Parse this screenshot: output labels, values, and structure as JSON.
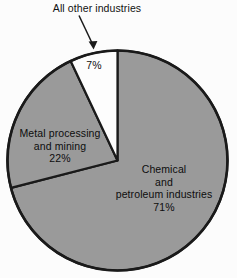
{
  "chart_data": {
    "type": "pie",
    "title": "",
    "categories": [
      "Chemical and petroleum industries",
      "Metal processing and mining",
      "All other industries"
    ],
    "values": [
      71,
      22,
      7
    ],
    "unit": "%",
    "start_angle_deg": 0,
    "direction": "clockwise",
    "legend": "none",
    "grid": false,
    "slices": [
      {
        "key": "chemical",
        "name": "Chemical and petroleum industries",
        "value": 71,
        "value_label": "71%",
        "color": "#9a9a9a",
        "label_lines": [
          "Chemical",
          "and",
          "petroleum industries",
          "71%"
        ],
        "label_placement": "inside-right"
      },
      {
        "key": "metal",
        "name": "Metal processing and mining",
        "value": 22,
        "value_label": "22%",
        "color": "#9a9a9a",
        "label_lines": [
          "Metal processing",
          "and mining",
          "22%"
        ],
        "label_placement": "inside-left"
      },
      {
        "key": "other",
        "name": "All other industries",
        "value": 7,
        "value_label": "7%",
        "color": "#fdfdfd",
        "label_lines": [
          "7%"
        ],
        "label_placement": "inside-top",
        "callout": {
          "text": "All other industries",
          "arrow": "down-right-arrow"
        }
      }
    ],
    "colors": {
      "slice_gray": "#9a9a9a",
      "slice_white": "#fdfdfd",
      "outline": "#1a1a1a",
      "background": "#fcfcfc",
      "text": "#0d0d0d"
    }
  },
  "callout": {
    "text": "All other industries"
  },
  "labels": {
    "other": {
      "pct": "7%"
    },
    "metal": {
      "line1": "Metal processing",
      "line2": "and mining",
      "pct": "22%"
    },
    "chemical": {
      "line1": "Chemical",
      "line2": "and",
      "line3": "petroleum industries",
      "pct": "71%"
    }
  }
}
